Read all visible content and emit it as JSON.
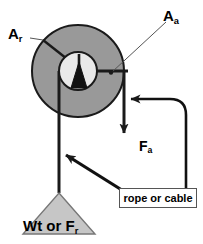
{
  "diagram": {
    "colors": {
      "pulley_fill": "#999999",
      "hub_fill": "#e9e9e9",
      "weight_fill": "#c6c6c6",
      "stroke": "#1a1a1a",
      "box_border": "#555555",
      "background": "#ffffff"
    },
    "labels": {
      "resistance_arm": {
        "base": "A",
        "sub": "r"
      },
      "effort_arm": {
        "base": "A",
        "sub": "a"
      },
      "applied_force": {
        "base": "F",
        "sub": "a"
      },
      "weight": {
        "prefix": "Wt or F",
        "sub": "r"
      }
    },
    "callout": {
      "rope_or_cable": "rope or cable"
    },
    "icons": {
      "pulley": "pulley-wheel-icon",
      "hub": "pulley-hub-icon",
      "axle_pointer": "axle-pointer-triangle-icon",
      "weight": "weight-triangle-icon",
      "force_arrow": "downward-force-arrow-icon",
      "callout_arrow_curved": "curved-callout-arrow-icon",
      "callout_arrow_straight": "straight-callout-arrow-icon",
      "leader_line_ar": "leader-line-icon",
      "leader_line_aa": "leader-line-icon"
    }
  }
}
